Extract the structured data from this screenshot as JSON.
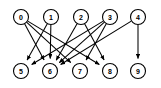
{
  "figure": {
    "kind": "directed-bipartite-graph",
    "width": 161,
    "height": 88,
    "background_color": "#ffffff",
    "node_fill_color": "#ffffff",
    "node_stroke_color": "#000000",
    "edge_color": "#000000",
    "label_color": "#000000",
    "node_radius": 7.5,
    "arrowhead": "filled-triangle"
  },
  "nodes": [
    {
      "id": "0",
      "label": "0",
      "cx": 21,
      "cy": 17,
      "layer": "top"
    },
    {
      "id": "1",
      "label": "1",
      "cx": 51,
      "cy": 17,
      "layer": "top"
    },
    {
      "id": "2",
      "label": "2",
      "cx": 81,
      "cy": 17,
      "layer": "top"
    },
    {
      "id": "3",
      "label": "3",
      "cx": 110,
      "cy": 17,
      "layer": "top"
    },
    {
      "id": "4",
      "label": "4",
      "cx": 138,
      "cy": 17,
      "layer": "top"
    },
    {
      "id": "5",
      "label": "5",
      "cx": 21,
      "cy": 71,
      "layer": "bottom"
    },
    {
      "id": "6",
      "label": "6",
      "cx": 50,
      "cy": 71,
      "layer": "bottom"
    },
    {
      "id": "7",
      "label": "7",
      "cx": 80,
      "cy": 71,
      "layer": "bottom"
    },
    {
      "id": "8",
      "label": "8",
      "cx": 110,
      "cy": 71,
      "layer": "bottom"
    },
    {
      "id": "9",
      "label": "9",
      "cx": 138,
      "cy": 71,
      "layer": "bottom"
    }
  ],
  "edges": [
    {
      "id": "e0",
      "from": "0",
      "to": "6",
      "directed": true
    },
    {
      "id": "e1",
      "from": "0",
      "to": "7",
      "directed": true
    },
    {
      "id": "e2",
      "from": "0",
      "to": "8",
      "directed": true
    },
    {
      "id": "e3",
      "from": "1",
      "to": "5",
      "directed": true
    },
    {
      "id": "e4",
      "from": "1",
      "to": "6",
      "directed": true
    },
    {
      "id": "e5",
      "from": "2",
      "to": "6",
      "directed": true
    },
    {
      "id": "e6",
      "from": "2",
      "to": "8",
      "directed": true
    },
    {
      "id": "e7",
      "from": "3",
      "to": "5",
      "directed": true
    },
    {
      "id": "e8",
      "from": "3",
      "to": "6",
      "directed": true
    },
    {
      "id": "e9",
      "from": "3",
      "to": "7",
      "directed": true
    },
    {
      "id": "e10",
      "from": "4",
      "to": "9",
      "directed": true
    },
    {
      "id": "e11",
      "from": "4",
      "to": "6",
      "directed": true
    }
  ]
}
